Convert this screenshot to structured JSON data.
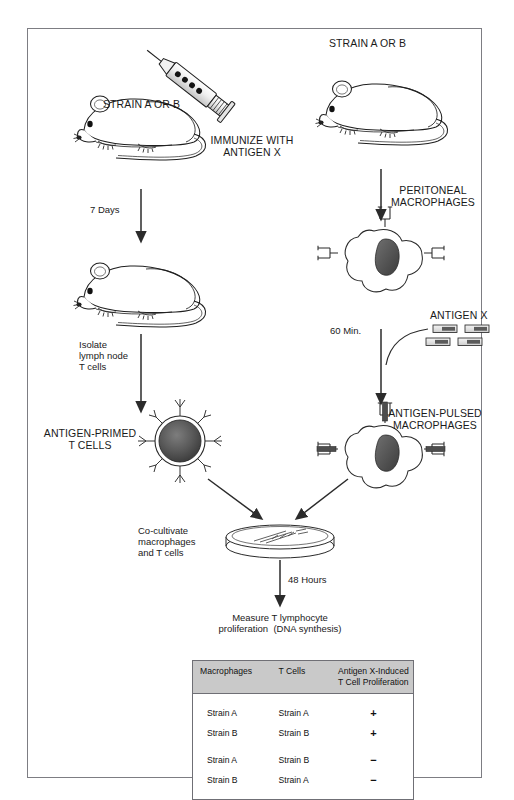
{
  "diagram": {
    "frame": {
      "border_color": "#7d7d83"
    },
    "left_branch": {
      "strain_label": "STRAIN A OR B",
      "immunize_label": "IMMUNIZE WITH\nANTIGEN X",
      "step_7days": "7 Days",
      "isolate_label": "Isolate\nlymph node\nT cells",
      "primed_label": "ANTIGEN-PRIMED\nT CELLS"
    },
    "right_branch": {
      "strain_label": "STRAIN A OR B",
      "peritoneal_label": "PERITONEAL\nMACROPHAGES",
      "antigen_label": "ANTIGEN X",
      "step_60min": "60 Min.",
      "pulsed_label": "ANTIGEN-PULSED\nMACROPHAGES"
    },
    "merge": {
      "cocultivate_label": "Co-cultivate\nmacrophages\nand T cells",
      "step_48hours": "48 Hours",
      "measure_label": "Measure T lymphocyte\nproliferation  (DNA synthesis)"
    },
    "icons": {
      "mouse": "mouse-icon",
      "syringe": "syringe-icon",
      "macrophage": "macrophage-icon",
      "t-cell": "t-cell-icon",
      "antigen": "antigen-fragment-icon",
      "petri-dish": "petri-dish-icon",
      "arrow": "arrow-icon"
    }
  },
  "results_table": {
    "headers": [
      "Macrophages",
      "T Cells",
      "Antigen X-Induced\nT Cell Proliferation"
    ],
    "rows": [
      {
        "macrophages": "Strain A",
        "t_cells": "Strain A",
        "proliferation": "+"
      },
      {
        "macrophages": "Strain B",
        "t_cells": "Strain B",
        "proliferation": "+"
      },
      {
        "macrophages": "Strain A",
        "t_cells": "Strain B",
        "proliferation": "−"
      },
      {
        "macrophages": "Strain B",
        "t_cells": "Strain A",
        "proliferation": "−"
      }
    ],
    "header_bg": "#c9c9c9",
    "border_color": "#6f6f75"
  },
  "watermark": {
    "text": ""
  }
}
